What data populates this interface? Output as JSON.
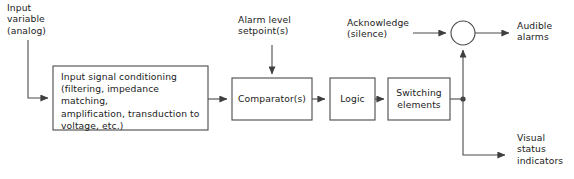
{
  "diagram": {
    "type": "block-diagram",
    "background_color": "#ffffff",
    "line_color": "#4a4a4a",
    "text_color": "#1b1b1b",
    "labels": {
      "input_variable": "Input\nvariable\n(analog)",
      "alarm_setpoint": "Alarm level\nsetpoint(s)",
      "acknowledge": "Acknowledge\n(silence)",
      "audible_alarms": "Audible\nalarms",
      "visual_status": "Visual\nstatus\nindicators"
    },
    "blocks": [
      {
        "id": "input-signal-conditioning",
        "label": "Input signal conditioning\n(filtering, impedance matching,\namplification, transduction to\nvoltage, etc.)",
        "x": 53,
        "y": 66,
        "w": 155,
        "h": 64
      },
      {
        "id": "comparators",
        "label": "Comparator(s)",
        "x": 232,
        "y": 78,
        "w": 80,
        "h": 42
      },
      {
        "id": "logic",
        "label": "Logic",
        "x": 330,
        "y": 78,
        "w": 45,
        "h": 42
      },
      {
        "id": "switching-elements",
        "label": "Switching\nelements",
        "x": 388,
        "y": 78,
        "w": 62,
        "h": 42
      }
    ],
    "nodes": [
      {
        "id": "summing-junction",
        "shape": "circle",
        "cx": 463,
        "cy": 33,
        "r": 12
      },
      {
        "id": "signal-split-dot",
        "shape": "dot",
        "cx": 463,
        "cy": 99,
        "r": 2.6
      }
    ]
  }
}
